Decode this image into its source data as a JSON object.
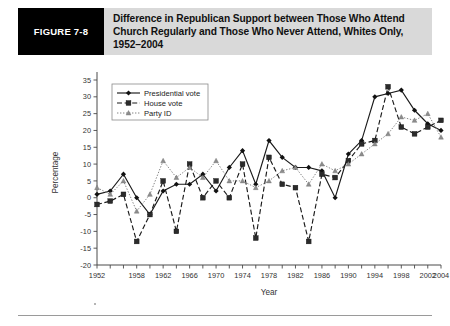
{
  "figure": {
    "label": "FIGURE 7-8",
    "title": "Difference in Republican Support between Those Who Attend Church Regularly and Those Who Never Attend, Whites Only, 1952–2004"
  },
  "chart_data": {
    "type": "line",
    "title": "",
    "xlabel": "Year",
    "ylabel": "Percentage",
    "ylim": [
      -20,
      35
    ],
    "xlim": [
      1952,
      2004
    ],
    "ytick_step": 5,
    "yticks": [
      35,
      30,
      25,
      20,
      15,
      10,
      5,
      0,
      -5,
      -10,
      -15,
      -20
    ],
    "xticks": [
      1952,
      1954,
      1956,
      1958,
      1960,
      1962,
      1964,
      1966,
      1968,
      1970,
      1972,
      1974,
      1976,
      1978,
      1980,
      1982,
      1984,
      1986,
      1988,
      1990,
      1992,
      1994,
      1996,
      1998,
      2000,
      2002,
      2004
    ],
    "xtick_labels": [
      "1952",
      "",
      "",
      "1958",
      "",
      "1962",
      "",
      "1966",
      "",
      "1970",
      "",
      "1974",
      "",
      "1978",
      "",
      "1982",
      "",
      "1986",
      "",
      "1990",
      "",
      "1994",
      "",
      "1998",
      "",
      "2002",
      "2004"
    ],
    "grid": false,
    "legend_position": "top-left",
    "x": [
      1952,
      1954,
      1956,
      1958,
      1960,
      1962,
      1964,
      1966,
      1968,
      1970,
      1972,
      1974,
      1976,
      1978,
      1980,
      1982,
      1984,
      1986,
      1988,
      1990,
      1992,
      1994,
      1996,
      1998,
      2000,
      2002,
      2004
    ],
    "series": [
      {
        "name": "Presidential vote",
        "marker": "diamond",
        "linestyle": "solid",
        "values": [
          1,
          2,
          7,
          0,
          -5,
          2,
          4,
          4,
          7,
          2,
          9,
          14,
          4,
          17,
          12,
          9,
          9,
          8,
          0,
          13,
          17,
          30,
          31,
          32,
          26,
          22,
          20
        ]
      },
      {
        "name": "House vote",
        "marker": "square",
        "linestyle": "dashed",
        "values": [
          -2,
          -1,
          1,
          -13,
          -5,
          5,
          -10,
          10,
          0,
          5,
          0,
          10,
          -12,
          12,
          4,
          3,
          -13,
          7,
          6,
          11,
          16,
          17,
          33,
          21,
          19,
          21,
          23
        ]
      },
      {
        "name": "Party ID",
        "marker": "triangle",
        "linestyle": "dotted",
        "values": [
          3,
          1,
          5,
          -4,
          1,
          11,
          6,
          9,
          6,
          11,
          5,
          5,
          3,
          5,
          8,
          9,
          4,
          10,
          8,
          10,
          13,
          16,
          19,
          24,
          23,
          25,
          18
        ]
      }
    ]
  }
}
